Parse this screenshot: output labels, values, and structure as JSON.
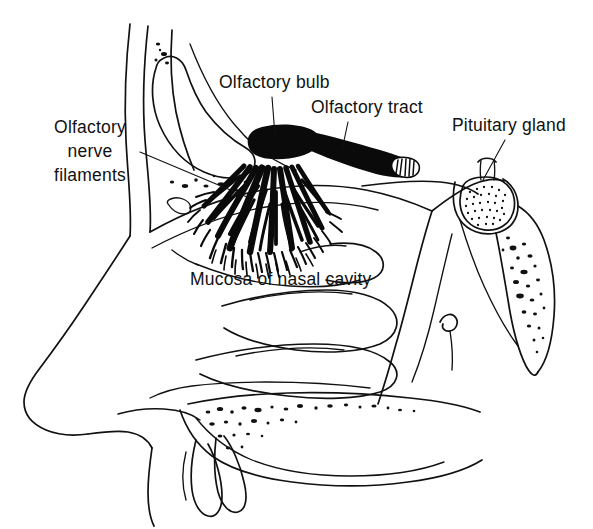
{
  "figure": {
    "background_color": "#ffffff",
    "ink_color": "#111111",
    "width": 593,
    "height": 529
  },
  "labels": [
    {
      "id": "olfactory-nerve-filaments",
      "lines": [
        "Olfactory",
        "nerve",
        "filaments"
      ],
      "align": "center",
      "x": 90,
      "y": 133,
      "line_height": 24,
      "leader": {
        "x1": 140,
        "y1": 152,
        "x2": 247,
        "y2": 197
      }
    },
    {
      "id": "olfactory-bulb",
      "lines": [
        "Olfactory bulb"
      ],
      "align": "start",
      "x": 219,
      "y": 88,
      "line_height": 24,
      "leader": {
        "x1": 272,
        "y1": 97,
        "x2": 275,
        "y2": 136
      }
    },
    {
      "id": "olfactory-tract",
      "lines": [
        "Olfactory tract"
      ],
      "align": "start",
      "x": 311,
      "y": 113,
      "line_height": 24,
      "leader": {
        "x1": 348,
        "y1": 122,
        "x2": 342,
        "y2": 150
      }
    },
    {
      "id": "pituitary-gland",
      "lines": [
        "Pituitary gland"
      ],
      "align": "start",
      "x": 452,
      "y": 131,
      "line_height": 24,
      "leader": {
        "x1": 505,
        "y1": 140,
        "x2": 483,
        "y2": 180
      }
    },
    {
      "id": "mucosa-of-nasal-cavity",
      "lines": [
        "Mucosa of nasal cavity"
      ],
      "align": "start",
      "x": 190,
      "y": 285,
      "line_height": 24,
      "leader": null
    }
  ],
  "structures": [
    {
      "id": "olfactory-bulb",
      "kind": "solid-black-ovoid",
      "description": "Dense black ovoid cap at roof of nasal cavity"
    },
    {
      "id": "olfactory-tract",
      "kind": "solid-black-band",
      "description": "Black band running posteriorly with hatched cut end"
    },
    {
      "id": "olfactory-nerve-filaments",
      "kind": "branched-fan",
      "description": "Fan of branching black nerve filaments descending through cribriform plate"
    },
    {
      "id": "pituitary-gland",
      "kind": "stippled-oval",
      "description": "Stippled oval gland in sella turcica with infundibular stalk"
    },
    {
      "id": "frontal-sinus",
      "kind": "outline-cavity",
      "description": "Frontal sinus air cavity in forehead"
    },
    {
      "id": "sphenoid-bone",
      "kind": "stippled-bone",
      "description": "Sphenoid and clivus with marrow stippling"
    },
    {
      "id": "nasal-turbinates",
      "kind": "outline-shelves",
      "description": "Superior, middle and inferior nasal conchae"
    },
    {
      "id": "hard-palate",
      "kind": "stippled-bone",
      "description": "Hard palate with marrow stippling and incisor teeth"
    },
    {
      "id": "facial-profile",
      "kind": "outline",
      "description": "External profile of nose, lip and chin"
    }
  ]
}
